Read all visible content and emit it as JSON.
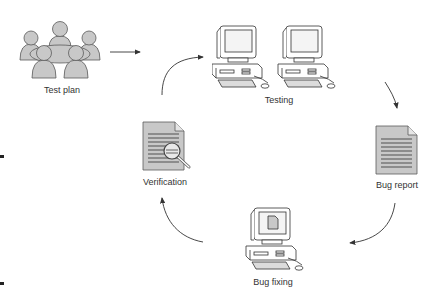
{
  "diagram": {
    "type": "cycle",
    "nodes": [
      {
        "id": "test-plan",
        "label": "Test plan",
        "icon": "people-meeting-icon"
      },
      {
        "id": "testing",
        "label": "Testing",
        "icon": "two-desktop-computers-icon"
      },
      {
        "id": "bug-report",
        "label": "Bug report",
        "icon": "document-icon"
      },
      {
        "id": "bug-fixing",
        "label": "Bug fixing",
        "icon": "desktop-computer-with-document-icon"
      },
      {
        "id": "verification",
        "label": "Verification",
        "icon": "document-magnifier-icon"
      }
    ],
    "edges": [
      {
        "from": "test-plan",
        "to": "testing",
        "style": "straight-arrow"
      },
      {
        "from": "testing",
        "to": "bug-report",
        "style": "curved-arrow"
      },
      {
        "from": "bug-report",
        "to": "bug-fixing",
        "style": "curved-arrow"
      },
      {
        "from": "bug-fixing",
        "to": "verification",
        "style": "curved-arrow"
      },
      {
        "from": "verification",
        "to": "testing",
        "style": "curved-arrow"
      }
    ],
    "colors": {
      "icon_fill": "#c8c8c8",
      "icon_stroke": "#5a5a5a",
      "arrow": "#333333",
      "text": "#333333"
    }
  }
}
